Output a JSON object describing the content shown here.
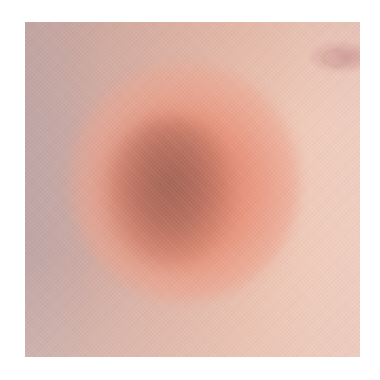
{
  "image": {
    "subject": "close-up of skin with a round reddish-brown patch",
    "background_color": "#ffffff",
    "photo_bounds": {
      "left": 25,
      "top": 22,
      "width": 335,
      "height": 335
    },
    "colors": {
      "center_patch": "#a86e60",
      "patch_halo": "#e2866c",
      "left_skin": "#c6a7a3",
      "right_skin": "#efcdc0",
      "navel_highlight": "#cd9696"
    },
    "features": [
      {
        "name": "erythematous patch",
        "position": "center-left",
        "shape": "oval"
      },
      {
        "name": "navel fold",
        "position": "top-right corner"
      }
    ]
  }
}
